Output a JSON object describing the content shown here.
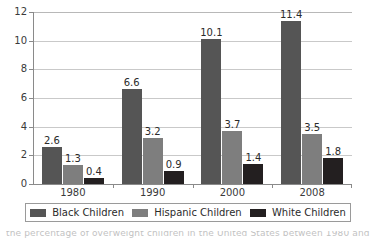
{
  "chart_data": {
    "type": "bar",
    "title": "",
    "subtitle": "",
    "xlabel": "",
    "ylabel": "",
    "categories": [
      "1980",
      "1990",
      "2000",
      "2008"
    ],
    "series": [
      {
        "name": "Black Children",
        "color": "#555555",
        "values": [
          2.6,
          6.6,
          10.1,
          11.4
        ],
        "labels": [
          "2.6",
          "6.6",
          "10.1",
          "11.4"
        ]
      },
      {
        "name": "Hispanic Children",
        "color": "#7e7e7e",
        "values": [
          1.3,
          3.2,
          3.7,
          3.5
        ],
        "labels": [
          "1.3",
          "3.2",
          "3.7",
          "3.5"
        ]
      },
      {
        "name": "White Children",
        "color": "#231f20",
        "values": [
          0.4,
          0.9,
          1.4,
          1.8
        ],
        "labels": [
          "0.4",
          "0.9",
          "1.4",
          "1.8"
        ]
      }
    ],
    "ylim": [
      0,
      12
    ],
    "yticks": [
      0,
      2,
      4,
      6,
      8,
      10,
      12
    ],
    "ytick_labels": [
      "0",
      "2",
      "4",
      "6",
      "8",
      "10",
      "12"
    ],
    "grid": true,
    "grid_axis": "y",
    "grid_color": "#c9c9c9",
    "legend_position": "bottom",
    "data_labels": true,
    "background_color": "#ffffff",
    "axis_color": "#8a8a8a",
    "text_color": "#2b2b2b"
  },
  "legend": {
    "items": [
      {
        "label": "Black Children",
        "color": "#555555"
      },
      {
        "label": "Hispanic Children",
        "color": "#7e7e7e"
      },
      {
        "label": "White Children",
        "color": "#231f20"
      }
    ]
  },
  "caption": {
    "cropped_line": "lower portion of caption text cut off at image edge"
  }
}
